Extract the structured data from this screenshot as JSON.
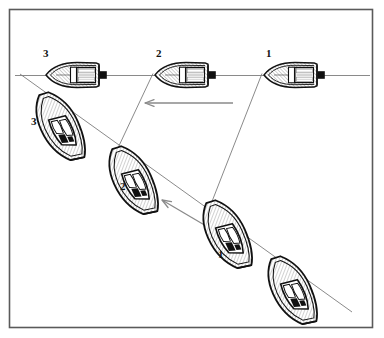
{
  "figure": {
    "background_color": "#ffffff",
    "border_color": "#555555",
    "line_color": "#666666",
    "ink_color": "#111111",
    "hull_fill": "#f2f2f2",
    "motor_color": "#111111"
  },
  "labels": {
    "plan_3": "3",
    "plan_2": "2",
    "plan_1": "1",
    "persp_3": "3",
    "persp_2": "2",
    "persp_1": "1"
  },
  "arrows": {
    "upper": {
      "name": "horizontal-direction-arrow",
      "direction": "left"
    },
    "lower": {
      "name": "diagonal-direction-arrow",
      "direction": "up-left"
    }
  },
  "boats": {
    "plan_view": [
      {
        "position": "3",
        "label": "3",
        "orientation": "bow-left"
      },
      {
        "position": "2",
        "label": "2",
        "orientation": "bow-left"
      },
      {
        "position": "1",
        "label": "1",
        "orientation": "bow-left"
      }
    ],
    "perspective_view": [
      {
        "position": "3",
        "label": "3",
        "orientation": "bow-up-left"
      },
      {
        "position": "2",
        "label": "2",
        "orientation": "bow-up-left"
      },
      {
        "position": "1",
        "label": "1",
        "orientation": "bow-up-left"
      },
      {
        "position": "4",
        "label": "",
        "orientation": "bow-up-left"
      }
    ]
  }
}
